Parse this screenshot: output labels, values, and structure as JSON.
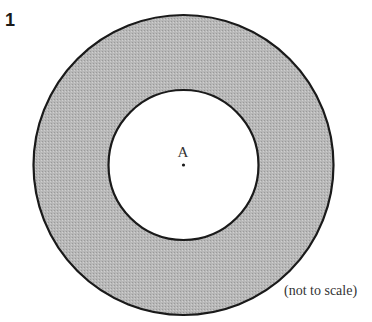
{
  "question": {
    "number": "1"
  },
  "figure": {
    "type": "annulus",
    "outer_circle": {
      "cx": 183.5,
      "cy": 165,
      "r": 150,
      "fill": "#b4b4b4",
      "stroke": "#1a1a1a"
    },
    "inner_circle": {
      "cx": 183.5,
      "cy": 165,
      "r": 75,
      "fill": "#ffffff",
      "stroke": "#1a1a1a"
    },
    "center_point": {
      "label": "A",
      "x": 183.5,
      "y": 165
    },
    "note": "(not to scale)"
  }
}
